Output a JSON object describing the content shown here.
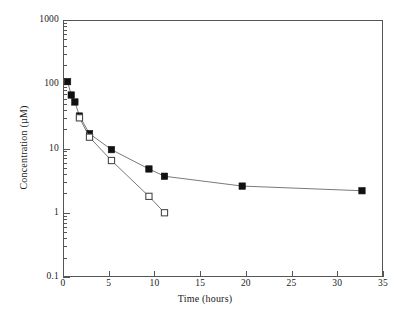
{
  "chart_data": {
    "type": "line",
    "title": "",
    "xlabel": "Time (hours)",
    "ylabel": "Concentration  (µM)",
    "xlim": [
      0,
      35
    ],
    "ylim": [
      0.1,
      1000
    ],
    "yscale": "log",
    "xscale": "linear",
    "grid": false,
    "legend": "none",
    "xticks": [
      "0",
      "5",
      "10",
      "15",
      "20",
      "25",
      "30",
      "35"
    ],
    "xtick_values": [
      0,
      5,
      10,
      15,
      20,
      25,
      30,
      35
    ],
    "yticks": [
      "1000",
      "100",
      "10",
      "1",
      "0.1"
    ],
    "ytick_values": [
      1000,
      100,
      10,
      1,
      0.1
    ],
    "series": [
      {
        "name": "filled-squares",
        "marker": "filled-square",
        "color": "#111111",
        "x": [
          0.5,
          0.9,
          1.3,
          1.8,
          2.9,
          5.3,
          9.4,
          11.1,
          19.6,
          32.7
        ],
        "y": [
          110,
          68,
          53,
          32,
          17,
          9.6,
          4.8,
          3.7,
          2.6,
          2.2
        ]
      },
      {
        "name": "open-squares",
        "marker": "open-square",
        "color": "#111111",
        "x": [
          1.8,
          2.9,
          5.3,
          9.4,
          11.1
        ],
        "y": [
          30,
          15,
          6.5,
          1.8,
          1.0
        ]
      }
    ]
  }
}
